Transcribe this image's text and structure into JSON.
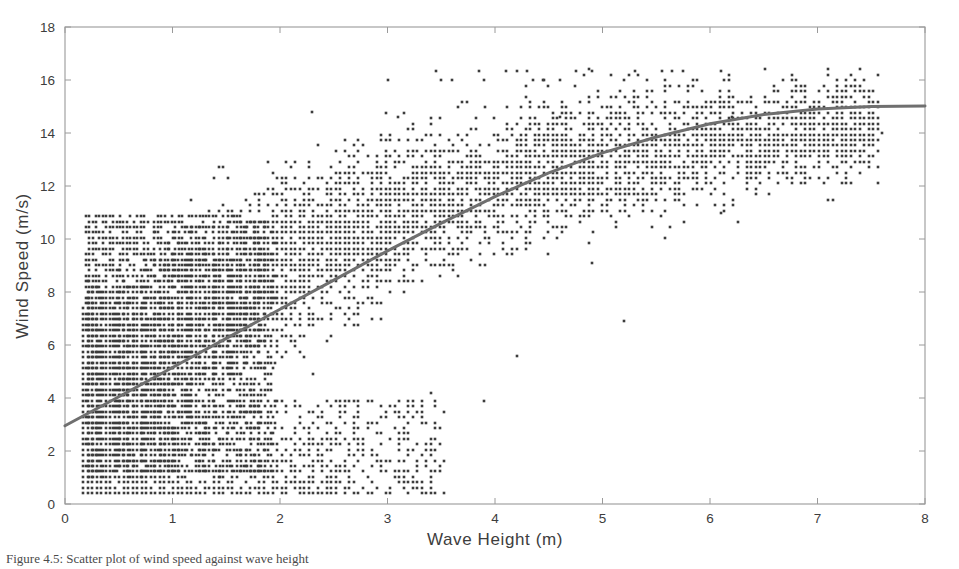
{
  "figure": {
    "background_color": "#ffffff",
    "axis_color": "#9a9a9a",
    "point_color": "#3c3c3c",
    "curve_color": "#6f6f6f",
    "text_color": "#3d3d3d",
    "caption": "Figure 4.5: Scatter plot of wind speed against wave height"
  },
  "chart_data": {
    "type": "scatter",
    "title": "",
    "xlabel": "Wave Height (m)",
    "ylabel": "Wind Speed (m/s)",
    "xlim": [
      0,
      8
    ],
    "ylim": [
      0,
      18
    ],
    "xticks": [
      0,
      1,
      2,
      3,
      4,
      5,
      6,
      7,
      8
    ],
    "yticks": [
      0,
      2,
      4,
      6,
      8,
      10,
      12,
      14,
      16,
      18
    ],
    "xtick_labels": [
      "0",
      "1",
      "2",
      "3",
      "4",
      "5",
      "6",
      "7",
      "8"
    ],
    "ytick_labels": [
      "0",
      "2",
      "4",
      "6",
      "8",
      "10",
      "12",
      "14",
      "16",
      "18"
    ],
    "grid": false,
    "legend": null,
    "marker": "square",
    "marker_size_px": 2.6,
    "series": [
      {
        "name": "Observations",
        "type": "scatter",
        "color": "#3c3c3c",
        "n_points_approx": 6500,
        "x_range": [
          0.15,
          7.65
        ],
        "y_range": [
          0.3,
          16.4
        ],
        "density_bands": [
          {
            "x_from": 0.2,
            "x_to": 1.9,
            "y_from": 0.3,
            "y_to": 11.5,
            "weight": 1.0
          },
          {
            "x_from": 0.2,
            "x_to": 3.0,
            "y_from": 2.5,
            "y_to": 12.5,
            "weight": 0.62
          },
          {
            "x_from": 1.0,
            "x_to": 4.2,
            "y_from": 4.0,
            "y_to": 13.5,
            "weight": 0.3
          },
          {
            "x_from": 2.0,
            "x_to": 5.5,
            "y_from": 6.0,
            "y_to": 15.0,
            "weight": 0.12
          },
          {
            "x_from": 3.0,
            "x_to": 7.7,
            "y_from": 9.0,
            "y_to": 16.4,
            "weight": 0.04
          },
          {
            "x_from": 0.5,
            "x_to": 4.3,
            "y_from": 0.3,
            "y_to": 3.0,
            "weight": 0.22
          }
        ],
        "outliers": [
          {
            "x": 3.45,
            "y": 16.35
          },
          {
            "x": 3.85,
            "y": 16.35
          },
          {
            "x": 4.1,
            "y": 16.35
          },
          {
            "x": 4.2,
            "y": 16.35
          },
          {
            "x": 4.3,
            "y": 16.35
          },
          {
            "x": 4.75,
            "y": 16.35
          },
          {
            "x": 4.9,
            "y": 16.35
          },
          {
            "x": 5.3,
            "y": 16.35
          },
          {
            "x": 5.55,
            "y": 16.35
          },
          {
            "x": 5.65,
            "y": 16.35
          },
          {
            "x": 5.75,
            "y": 16.35
          },
          {
            "x": 6.1,
            "y": 16.35
          },
          {
            "x": 3.0,
            "y": 16.0
          },
          {
            "x": 3.5,
            "y": 16.0
          },
          {
            "x": 3.6,
            "y": 16.0
          },
          {
            "x": 3.9,
            "y": 16.0
          },
          {
            "x": 4.35,
            "y": 16.0
          },
          {
            "x": 4.45,
            "y": 16.0
          },
          {
            "x": 4.6,
            "y": 16.0
          },
          {
            "x": 5.2,
            "y": 16.0
          },
          {
            "x": 2.3,
            "y": 14.8
          },
          {
            "x": 3.1,
            "y": 14.6
          },
          {
            "x": 4.6,
            "y": 14.6
          },
          {
            "x": 6.2,
            "y": 14.6
          },
          {
            "x": 7.6,
            "y": 14.0
          },
          {
            "x": 6.1,
            "y": 11.0
          },
          {
            "x": 4.9,
            "y": 9.1
          },
          {
            "x": 5.2,
            "y": 6.9
          },
          {
            "x": 4.2,
            "y": 5.6
          },
          {
            "x": 3.4,
            "y": 4.2
          },
          {
            "x": 3.9,
            "y": 3.9
          }
        ]
      },
      {
        "name": "Fitted trend",
        "type": "line",
        "color": "#6f6f6f",
        "width_px": 3,
        "model": "saturating growth",
        "points": [
          {
            "x": 0.0,
            "y": 2.95
          },
          {
            "x": 0.5,
            "y": 4.05
          },
          {
            "x": 1.0,
            "y": 5.15
          },
          {
            "x": 1.5,
            "y": 6.25
          },
          {
            "x": 2.0,
            "y": 7.35
          },
          {
            "x": 2.5,
            "y": 8.45
          },
          {
            "x": 3.0,
            "y": 9.55
          },
          {
            "x": 3.5,
            "y": 10.6
          },
          {
            "x": 4.0,
            "y": 11.6
          },
          {
            "x": 4.5,
            "y": 12.5
          },
          {
            "x": 5.0,
            "y": 13.25
          },
          {
            "x": 5.5,
            "y": 13.85
          },
          {
            "x": 6.0,
            "y": 14.35
          },
          {
            "x": 6.5,
            "y": 14.7
          },
          {
            "x": 7.0,
            "y": 14.9
          },
          {
            "x": 7.5,
            "y": 15.0
          },
          {
            "x": 8.0,
            "y": 15.02
          }
        ]
      }
    ]
  }
}
